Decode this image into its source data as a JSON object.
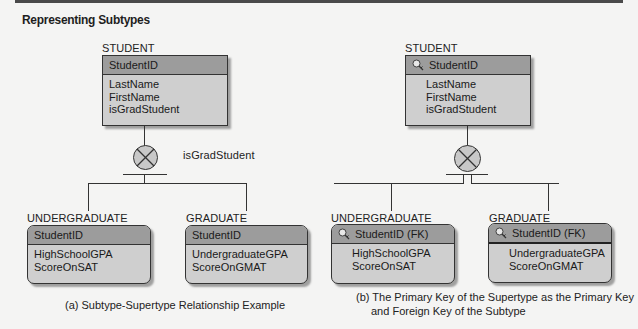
{
  "title": "Representing Subtypes",
  "panel_a": {
    "supertype": {
      "name": "STUDENT",
      "key": "StudentID",
      "attributes": [
        "LastName",
        "FirstName",
        "isGradStudent"
      ]
    },
    "discriminator": "isGradStudent",
    "subtypes": [
      {
        "name": "UNDERGRADUATE",
        "key": "StudentID",
        "attributes": [
          "HighSchoolGPA",
          "ScoreOnSAT"
        ]
      },
      {
        "name": "GRADUATE",
        "key": "StudentID",
        "attributes": [
          "UndergraduateGPA",
          "ScoreOnGMAT"
        ]
      }
    ],
    "caption": "(a) Subtype-Supertype Relationship Example"
  },
  "panel_b": {
    "supertype": {
      "name": "STUDENT",
      "key": "StudentID",
      "key_icon": "key-icon",
      "attributes": [
        "LastName",
        "FirstName",
        "isGradStudent"
      ]
    },
    "subtypes": [
      {
        "name": "UNDERGRADUATE",
        "key": "StudentID (FK)",
        "key_icon": "key-icon",
        "attributes": [
          "HighSchoolGPA",
          "ScoreOnSAT"
        ]
      },
      {
        "name": "GRADUATE",
        "key": "StudentID (FK)",
        "key_icon": "key-icon",
        "attributes": [
          "UndergraduateGPA",
          "ScoreOnGMAT"
        ]
      }
    ],
    "caption_line1": "(b) The Primary Key of the Supertype as the Primary Key",
    "caption_line2": "and Foreign Key of the Subtype"
  },
  "colors": {
    "background": "#f4f4f3",
    "entity_body": "#cfcfcf",
    "entity_header": "#9c9c9c",
    "category_symbol": "#c8c8c8",
    "line": "#333333"
  }
}
